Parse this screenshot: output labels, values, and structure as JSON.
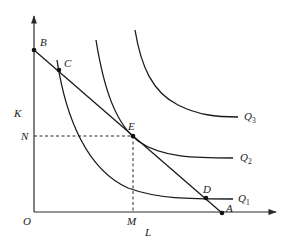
{
  "diagram": {
    "type": "isoquant-isocost",
    "axes": {
      "origin_label": "O",
      "y_label": "K",
      "x_label": "L"
    },
    "points": {
      "B": "B",
      "C": "C",
      "E": "E",
      "D": "D",
      "A": "A"
    },
    "reference_labels": {
      "N": "N",
      "M": "M"
    },
    "curves": [
      {
        "name": "Q",
        "sub": "1"
      },
      {
        "name": "Q",
        "sub": "2"
      },
      {
        "name": "Q",
        "sub": "3"
      }
    ],
    "colors": {
      "line": "#1a1a1a",
      "background": "#ffffff"
    }
  }
}
